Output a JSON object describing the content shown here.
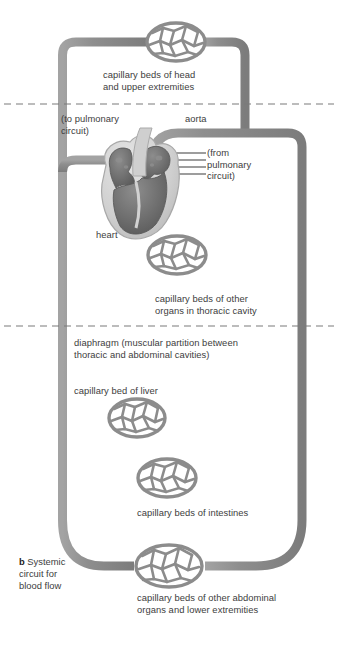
{
  "figure": {
    "key_letter": "b",
    "key_caption": "Systemic\ncircuit for\nblood flow",
    "title": "Systemic circuit for blood flow"
  },
  "colors": {
    "vessel": "#8c8c8c",
    "vessel_edge": "#6f6f6f",
    "capillary_net": "#8c8c8c",
    "heart_muscle": "#6e6e6e",
    "heart_outer": "#d6d6d6",
    "text": "#3d3d3d",
    "divider": "#7a7a7a",
    "background": "#ffffff"
  },
  "labels": {
    "capillary_head": "capillary beds of head\nand upper extremities",
    "to_pulmonary": "(to pulmonary\ncircuit)",
    "aorta": "aorta",
    "from_pulmonary": "(from\npulmonary\ncircuit)",
    "heart": "heart",
    "capillary_thoracic": "capillary beds of other\norgans in thoracic cavity",
    "diaphragm": "diaphragm (muscular partition between\nthoracic and abdominal cavities)",
    "capillary_liver": "capillary bed of liver",
    "capillary_intestines": "capillary beds of intestines",
    "capillary_abdominal": "capillary beds of other abdominal\norgans and lower extremities"
  },
  "icons": {
    "capillary_bed": "capillary-net-oval",
    "heart": "heart-cross-section",
    "diaphragm_line": "dashed-divider-line"
  },
  "structures": [
    {
      "name": "capillary-bed-head",
      "label_key": "capillary_head"
    },
    {
      "name": "capillary-bed-thoracic",
      "label_key": "capillary_thoracic"
    },
    {
      "name": "capillary-bed-liver",
      "label_key": "capillary_liver"
    },
    {
      "name": "capillary-bed-intestines",
      "label_key": "capillary_intestines"
    },
    {
      "name": "capillary-bed-abdominal",
      "label_key": "capillary_abdominal"
    },
    {
      "name": "heart",
      "label_key": "heart"
    },
    {
      "name": "aorta",
      "label_key": "aorta"
    }
  ],
  "dividers": [
    {
      "name": "upper-body-divider",
      "y": 104
    },
    {
      "name": "diaphragm-divider",
      "y": 325
    }
  ]
}
